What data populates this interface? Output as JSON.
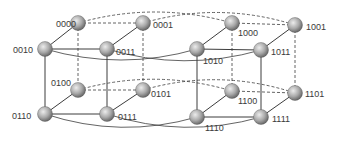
{
  "diagram": {
    "colors": {
      "node_light": "#e8e8e8",
      "node_dark": "#6a6a6a",
      "edge": "#3c3c3c",
      "label": "#3a3a3a"
    },
    "nodes": [
      {
        "id": "0000",
        "label": "0000",
        "x": 78,
        "y": 23,
        "lx": 56,
        "ly": 27,
        "anchor": "end-left"
      },
      {
        "id": "0001",
        "label": "0001",
        "x": 143,
        "y": 23,
        "lx": 153,
        "ly": 28
      },
      {
        "id": "1000",
        "label": "1000",
        "x": 232,
        "y": 23,
        "lx": 238,
        "ly": 36
      },
      {
        "id": "1001",
        "label": "1001",
        "x": 295,
        "y": 25,
        "lx": 306,
        "ly": 30
      },
      {
        "id": "0010",
        "label": "0010",
        "x": 45,
        "y": 49,
        "lx": 13,
        "ly": 53
      },
      {
        "id": "0011",
        "label": "0011",
        "x": 107,
        "y": 49,
        "lx": 116,
        "ly": 55
      },
      {
        "id": "1010",
        "label": "1010",
        "x": 197,
        "y": 49,
        "lx": 203,
        "ly": 64
      },
      {
        "id": "1011",
        "label": "1011",
        "x": 261,
        "y": 50,
        "lx": 271,
        "ly": 55
      },
      {
        "id": "0100",
        "label": "0100",
        "x": 78,
        "y": 90,
        "lx": 51,
        "ly": 86
      },
      {
        "id": "0101",
        "label": "0101",
        "x": 143,
        "y": 90,
        "lx": 151,
        "ly": 97
      },
      {
        "id": "1100",
        "label": "1100",
        "x": 232,
        "y": 91,
        "lx": 238,
        "ly": 104
      },
      {
        "id": "1101",
        "label": "1101",
        "x": 295,
        "y": 93,
        "lx": 305,
        "ly": 97
      },
      {
        "id": "0110",
        "label": "0110",
        "x": 45,
        "y": 114,
        "lx": 12,
        "ly": 119
      },
      {
        "id": "0111",
        "label": "0111",
        "x": 107,
        "y": 114,
        "lx": 118,
        "ly": 120
      },
      {
        "id": "1110",
        "label": "1110",
        "x": 197,
        "y": 117,
        "lx": 205,
        "ly": 131
      },
      {
        "id": "1111",
        "label": "1111",
        "x": 261,
        "y": 117,
        "lx": 272,
        "ly": 122
      }
    ],
    "edges_solid": [
      [
        "0000",
        "0010"
      ],
      [
        "0010",
        "0011"
      ],
      [
        "0011",
        "0001"
      ],
      [
        "0010",
        "0110"
      ],
      [
        "0011",
        "0111"
      ],
      [
        "0110",
        "0111"
      ],
      [
        "0110",
        "0100"
      ],
      [
        "0111",
        "0101"
      ],
      [
        "1000",
        "1010"
      ],
      [
        "1010",
        "1011"
      ],
      [
        "1011",
        "1001"
      ],
      [
        "1010",
        "1110"
      ],
      [
        "1011",
        "1111"
      ],
      [
        "1110",
        "1111"
      ],
      [
        "1110",
        "1100"
      ],
      [
        "1111",
        "1101"
      ]
    ],
    "edges_dashed": [
      [
        "0000",
        "0001"
      ],
      [
        "0000",
        "0100"
      ],
      [
        "0001",
        "0101"
      ],
      [
        "0100",
        "0101"
      ],
      [
        "1000",
        "1001"
      ],
      [
        "1000",
        "1100"
      ],
      [
        "1001",
        "1101"
      ],
      [
        "1100",
        "1101"
      ]
    ],
    "curves_solid": [
      {
        "from": "0010",
        "to": "1010"
      },
      {
        "from": "0011",
        "to": "1011"
      },
      {
        "from": "0110",
        "to": "1110"
      },
      {
        "from": "0111",
        "to": "1111"
      }
    ],
    "curves_dashed": [
      {
        "from": "0000",
        "to": "1000"
      },
      {
        "from": "0001",
        "to": "1001"
      },
      {
        "from": "0100",
        "to": "1100"
      },
      {
        "from": "0101",
        "to": "1101"
      }
    ]
  }
}
